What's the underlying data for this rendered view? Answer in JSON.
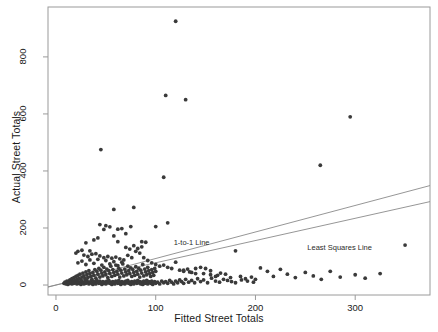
{
  "chart_data": {
    "type": "scatter",
    "title": "",
    "xlabel": "Fitted Street Totals",
    "ylabel": "Actual Street Totals",
    "xlim": [
      -8,
      375
    ],
    "ylim": [
      -35,
      975
    ],
    "xticks": [
      0,
      100,
      200,
      300
    ],
    "yticks": [
      0,
      200,
      400,
      600,
      800
    ],
    "grid": false,
    "legend": "none",
    "point_color": "#3a3a3a",
    "line_color": "#8a8a8a",
    "box_color": "#9a9a9a",
    "annotations": [
      {
        "text": "1-to-1 Line",
        "x": 118,
        "y": 148
      },
      {
        "text": "Least Squares Line",
        "x": 252,
        "y": 130
      }
    ],
    "lines": [
      {
        "name": "1-to-1 Line",
        "intercept": 0,
        "slope": 0.93
      },
      {
        "name": "Least Squares Line",
        "intercept": 0,
        "slope": 0.78
      }
    ],
    "points": [
      [
        120,
        925
      ],
      [
        110,
        665
      ],
      [
        130,
        650
      ],
      [
        45,
        475
      ],
      [
        295,
        590
      ],
      [
        265,
        420
      ],
      [
        108,
        378
      ],
      [
        58,
        265
      ],
      [
        78,
        272
      ],
      [
        75,
        205
      ],
      [
        100,
        205
      ],
      [
        48,
        195
      ],
      [
        62,
        196
      ],
      [
        66,
        198
      ],
      [
        112,
        218
      ],
      [
        86,
        152
      ],
      [
        90,
        150
      ],
      [
        62,
        152
      ],
      [
        38,
        158
      ],
      [
        42,
        165
      ],
      [
        30,
        148
      ],
      [
        34,
        120
      ],
      [
        26,
        122
      ],
      [
        22,
        118
      ],
      [
        20,
        112
      ],
      [
        28,
        105
      ],
      [
        32,
        100
      ],
      [
        36,
        108
      ],
      [
        40,
        110
      ],
      [
        44,
        102
      ],
      [
        48,
        96
      ],
      [
        52,
        100
      ],
      [
        56,
        94
      ],
      [
        60,
        98
      ],
      [
        64,
        92
      ],
      [
        68,
        88
      ],
      [
        72,
        104
      ],
      [
        76,
        96
      ],
      [
        80,
        118
      ],
      [
        84,
        112
      ],
      [
        88,
        96
      ],
      [
        92,
        86
      ],
      [
        96,
        78
      ],
      [
        100,
        72
      ],
      [
        104,
        66
      ],
      [
        108,
        70
      ],
      [
        112,
        62
      ],
      [
        116,
        58
      ],
      [
        120,
        80
      ],
      [
        124,
        52
      ],
      [
        128,
        48
      ],
      [
        132,
        56
      ],
      [
        136,
        44
      ],
      [
        140,
        40
      ],
      [
        145,
        62
      ],
      [
        150,
        58
      ],
      [
        155,
        36
      ],
      [
        160,
        30
      ],
      [
        165,
        42
      ],
      [
        170,
        38
      ],
      [
        175,
        26
      ],
      [
        180,
        120
      ],
      [
        185,
        30
      ],
      [
        190,
        22
      ],
      [
        196,
        28
      ],
      [
        200,
        20
      ],
      [
        12,
        10
      ],
      [
        13,
        14
      ],
      [
        14,
        18
      ],
      [
        15,
        8
      ],
      [
        16,
        22
      ],
      [
        17,
        12
      ],
      [
        18,
        26
      ],
      [
        19,
        16
      ],
      [
        20,
        30
      ],
      [
        21,
        20
      ],
      [
        22,
        34
      ],
      [
        23,
        24
      ],
      [
        24,
        38
      ],
      [
        25,
        18
      ],
      [
        26,
        28
      ],
      [
        27,
        42
      ],
      [
        28,
        32
      ],
      [
        29,
        22
      ],
      [
        30,
        46
      ],
      [
        31,
        36
      ],
      [
        32,
        26
      ],
      [
        33,
        50
      ],
      [
        34,
        40
      ],
      [
        35,
        30
      ],
      [
        36,
        20
      ],
      [
        37,
        44
      ],
      [
        38,
        34
      ],
      [
        39,
        54
      ],
      [
        40,
        24
      ],
      [
        41,
        48
      ],
      [
        42,
        38
      ],
      [
        43,
        58
      ],
      [
        44,
        28
      ],
      [
        45,
        52
      ],
      [
        46,
        42
      ],
      [
        47,
        32
      ],
      [
        48,
        62
      ],
      [
        49,
        46
      ],
      [
        50,
        36
      ],
      [
        51,
        56
      ],
      [
        52,
        26
      ],
      [
        53,
        50
      ],
      [
        54,
        40
      ],
      [
        55,
        66
      ],
      [
        56,
        30
      ],
      [
        57,
        54
      ],
      [
        58,
        44
      ],
      [
        59,
        34
      ],
      [
        60,
        70
      ],
      [
        61,
        48
      ],
      [
        62,
        38
      ],
      [
        63,
        58
      ],
      [
        64,
        28
      ],
      [
        65,
        52
      ],
      [
        66,
        42
      ],
      [
        67,
        74
      ],
      [
        68,
        32
      ],
      [
        69,
        56
      ],
      [
        70,
        46
      ],
      [
        71,
        36
      ],
      [
        72,
        66
      ],
      [
        73,
        50
      ],
      [
        74,
        40
      ],
      [
        75,
        60
      ],
      [
        76,
        30
      ],
      [
        77,
        54
      ],
      [
        78,
        44
      ],
      [
        79,
        34
      ],
      [
        80,
        64
      ],
      [
        81,
        48
      ],
      [
        82,
        38
      ],
      [
        83,
        58
      ],
      [
        84,
        28
      ],
      [
        85,
        52
      ],
      [
        86,
        42
      ],
      [
        87,
        72
      ],
      [
        88,
        32
      ],
      [
        89,
        56
      ],
      [
        90,
        46
      ],
      [
        91,
        36
      ],
      [
        92,
        62
      ],
      [
        93,
        50
      ],
      [
        94,
        40
      ],
      [
        95,
        30
      ],
      [
        96,
        54
      ],
      [
        97,
        44
      ],
      [
        98,
        34
      ],
      [
        99,
        58
      ],
      [
        100,
        48
      ],
      [
        8,
        6
      ],
      [
        9,
        10
      ],
      [
        10,
        4
      ],
      [
        11,
        14
      ],
      [
        12,
        2
      ],
      [
        13,
        8
      ],
      [
        14,
        6
      ],
      [
        15,
        12
      ],
      [
        16,
        4
      ],
      [
        17,
        10
      ],
      [
        18,
        6
      ],
      [
        19,
        16
      ],
      [
        20,
        8
      ],
      [
        21,
        4
      ],
      [
        22,
        12
      ],
      [
        23,
        6
      ],
      [
        24,
        10
      ],
      [
        25,
        2
      ],
      [
        26,
        14
      ],
      [
        27,
        8
      ],
      [
        28,
        4
      ],
      [
        29,
        12
      ],
      [
        30,
        6
      ],
      [
        31,
        16
      ],
      [
        32,
        10
      ],
      [
        33,
        4
      ],
      [
        34,
        8
      ],
      [
        35,
        14
      ],
      [
        36,
        6
      ],
      [
        37,
        2
      ],
      [
        38,
        12
      ],
      [
        39,
        8
      ],
      [
        40,
        4
      ],
      [
        41,
        16
      ],
      [
        42,
        10
      ],
      [
        43,
        6
      ],
      [
        44,
        14
      ],
      [
        45,
        8
      ],
      [
        46,
        2
      ],
      [
        47,
        12
      ],
      [
        48,
        6
      ],
      [
        49,
        10
      ],
      [
        50,
        4
      ],
      [
        51,
        14
      ],
      [
        52,
        8
      ],
      [
        53,
        16
      ],
      [
        54,
        6
      ],
      [
        55,
        10
      ],
      [
        56,
        2
      ],
      [
        57,
        12
      ],
      [
        58,
        8
      ],
      [
        59,
        4
      ],
      [
        60,
        14
      ],
      [
        61,
        10
      ],
      [
        62,
        6
      ],
      [
        63,
        16
      ],
      [
        64,
        8
      ],
      [
        65,
        2
      ],
      [
        66,
        12
      ],
      [
        67,
        6
      ],
      [
        68,
        10
      ],
      [
        69,
        4
      ],
      [
        70,
        14
      ],
      [
        71,
        8
      ],
      [
        72,
        16
      ],
      [
        73,
        6
      ],
      [
        74,
        10
      ],
      [
        75,
        2
      ],
      [
        76,
        12
      ],
      [
        77,
        8
      ],
      [
        78,
        4
      ],
      [
        79,
        14
      ],
      [
        80,
        10
      ],
      [
        81,
        6
      ],
      [
        82,
        16
      ],
      [
        83,
        8
      ],
      [
        84,
        12
      ],
      [
        85,
        4
      ],
      [
        86,
        10
      ],
      [
        87,
        2
      ],
      [
        88,
        14
      ],
      [
        89,
        6
      ],
      [
        90,
        8
      ],
      [
        91,
        16
      ],
      [
        92,
        4
      ],
      [
        93,
        12
      ],
      [
        94,
        10
      ],
      [
        95,
        6
      ],
      [
        96,
        14
      ],
      [
        97,
        2
      ],
      [
        98,
        8
      ],
      [
        99,
        12
      ],
      [
        100,
        6
      ],
      [
        102,
        10
      ],
      [
        104,
        4
      ],
      [
        106,
        14
      ],
      [
        108,
        8
      ],
      [
        110,
        12
      ],
      [
        112,
        6
      ],
      [
        114,
        16
      ],
      [
        116,
        10
      ],
      [
        118,
        4
      ],
      [
        120,
        14
      ],
      [
        122,
        8
      ],
      [
        124,
        18
      ],
      [
        126,
        12
      ],
      [
        128,
        6
      ],
      [
        130,
        20
      ],
      [
        133,
        10
      ],
      [
        136,
        16
      ],
      [
        139,
        8
      ],
      [
        142,
        22
      ],
      [
        145,
        12
      ],
      [
        148,
        18
      ],
      [
        152,
        8
      ],
      [
        156,
        24
      ],
      [
        160,
        14
      ],
      [
        164,
        10
      ],
      [
        168,
        20
      ],
      [
        172,
        16
      ],
      [
        176,
        12
      ],
      [
        180,
        8
      ],
      [
        186,
        18
      ],
      [
        192,
        14
      ],
      [
        198,
        10
      ],
      [
        128,
        52
      ],
      [
        134,
        46
      ],
      [
        140,
        58
      ],
      [
        148,
        40
      ],
      [
        155,
        50
      ],
      [
        162,
        34
      ],
      [
        205,
        60
      ],
      [
        212,
        48
      ],
      [
        218,
        30
      ],
      [
        225,
        55
      ],
      [
        232,
        38
      ],
      [
        240,
        26
      ],
      [
        250,
        44
      ],
      [
        258,
        32
      ],
      [
        266,
        20
      ],
      [
        275,
        48
      ],
      [
        285,
        28
      ],
      [
        300,
        36
      ],
      [
        310,
        24
      ],
      [
        325,
        40
      ],
      [
        350,
        140
      ],
      [
        22,
        78
      ],
      [
        26,
        84
      ],
      [
        30,
        72
      ],
      [
        34,
        88
      ],
      [
        38,
        76
      ],
      [
        42,
        90
      ],
      [
        46,
        70
      ],
      [
        50,
        86
      ],
      [
        54,
        74
      ],
      [
        58,
        82
      ],
      [
        62,
        68
      ],
      [
        66,
        80
      ],
      [
        70,
        132
      ],
      [
        74,
        126
      ],
      [
        78,
        138
      ],
      [
        82,
        128
      ],
      [
        86,
        134
      ],
      [
        44,
        212
      ],
      [
        50,
        208
      ],
      [
        54,
        204
      ],
      [
        70,
        180
      ],
      [
        58,
        172
      ]
    ]
  }
}
